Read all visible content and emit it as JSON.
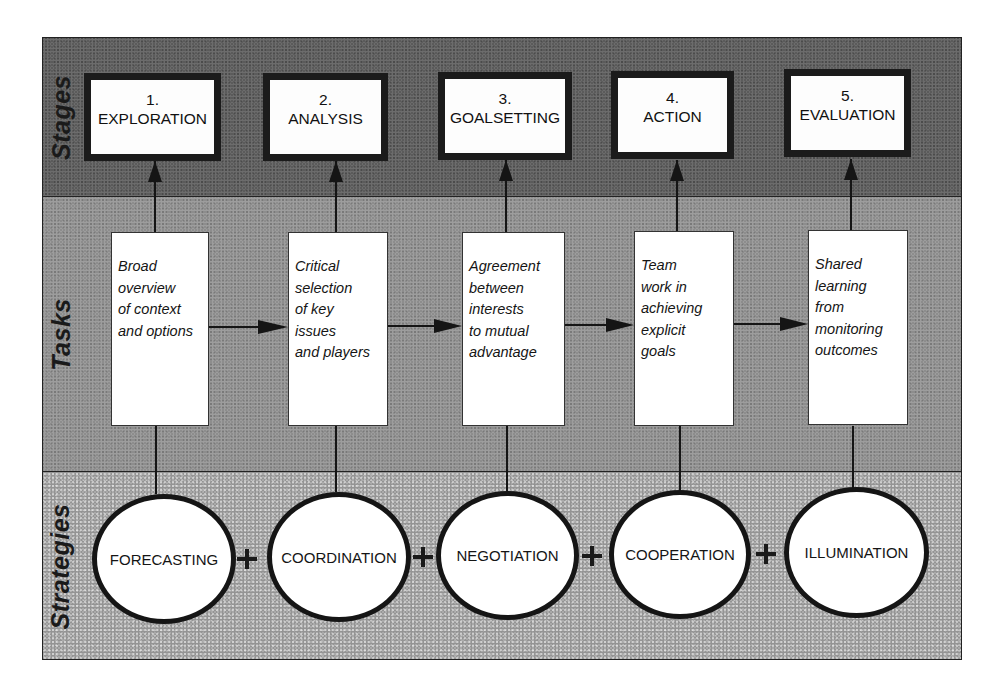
{
  "diagram": {
    "rows": {
      "stages": "Stages",
      "tasks": "Tasks",
      "strategies": "Strategies"
    },
    "stages": [
      {
        "number": "1.",
        "name": "EXPLORATION"
      },
      {
        "number": "2.",
        "name": "ANALYSIS"
      },
      {
        "number": "3.",
        "name": "GOALSETTING"
      },
      {
        "number": "4.",
        "name": "ACTION"
      },
      {
        "number": "5.",
        "name": "EVALUATION"
      }
    ],
    "tasks": [
      {
        "text": "Broad\noverview\nof context\nand options"
      },
      {
        "text": "Critical\nselection\nof key\nissues\nand players"
      },
      {
        "text": "Agreement\nbetween\ninterests\nto mutual\nadvantage"
      },
      {
        "text": "Team\nwork in\nachieving\nexplicit\ngoals"
      },
      {
        "text": "Shared\nlearning\nfrom\nmonitoring\noutcomes"
      }
    ],
    "strategies": [
      {
        "name": "FORECASTING"
      },
      {
        "name": "COORDINATION"
      },
      {
        "name": "NEGOTIATION"
      },
      {
        "name": "COOPERATION"
      },
      {
        "name": "ILLUMINATION"
      }
    ],
    "connector_symbol": "+",
    "colors": {
      "stages_band": "#5b5b5b",
      "tasks_band": "#8d8d8d",
      "strategies_band": "#a9a9a9",
      "box_fill": "#ffffff",
      "outline": "#1b1b1b"
    }
  }
}
